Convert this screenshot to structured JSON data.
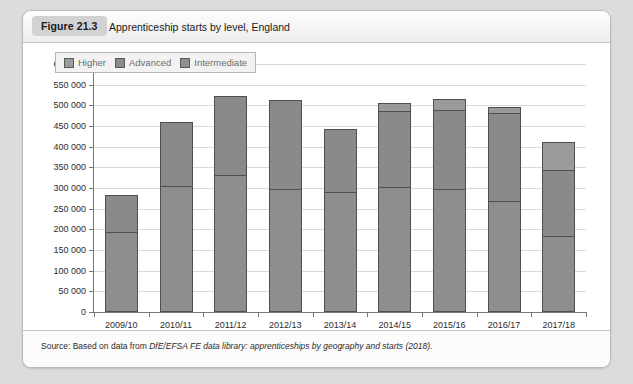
{
  "figure": {
    "badge": "Figure 21.3",
    "title": "Apprenticeship starts by level, England",
    "source_prefix": "Source: Based on data from ",
    "source_italic": "DfE/EFSA FE data library: apprenticeships by geography and starts (2018)",
    "source_suffix": "."
  },
  "chart_data": {
    "type": "bar",
    "stacked": true,
    "title": "Apprenticeship starts by level, England",
    "xlabel": "",
    "ylabel": "",
    "ylim": [
      0,
      600000
    ],
    "ytick_step": 50000,
    "grid": true,
    "legend_position": "top-left",
    "ytick_labels": [
      "0",
      "50 000",
      "100 000",
      "150 000",
      "200 000",
      "250 000",
      "300 000",
      "350 000",
      "400 000",
      "450 000",
      "500 000",
      "550 000",
      "600 000"
    ],
    "ytick_values": [
      0,
      50000,
      100000,
      150000,
      200000,
      250000,
      300000,
      350000,
      400000,
      450000,
      500000,
      550000,
      600000
    ],
    "categories": [
      "2009/10",
      "2010/11",
      "2011/12",
      "2012/13",
      "2013/14",
      "2014/15",
      "2015/16",
      "2016/17",
      "2017/18"
    ],
    "series": [
      {
        "name": "Intermediate",
        "color": "#8e8e8e",
        "values": [
          190000,
          302000,
          330000,
          295000,
          288000,
          300000,
          295000,
          265000,
          182000
        ]
      },
      {
        "name": "Advanced",
        "color": "#8a8a8a",
        "values": [
          90000,
          155000,
          191000,
          215000,
          152000,
          185000,
          192000,
          215000,
          159000
        ]
      },
      {
        "name": "Higher",
        "color": "#9a9a9a",
        "values": [
          0,
          0,
          0,
          0,
          0,
          19000,
          25000,
          14000,
          69000
        ]
      }
    ],
    "totals": [
      280000,
      457000,
      521000,
      510000,
      440000,
      504000,
      512000,
      494000,
      410000
    ],
    "legend": [
      "Higher",
      "Advanced",
      "Intermediate"
    ]
  }
}
